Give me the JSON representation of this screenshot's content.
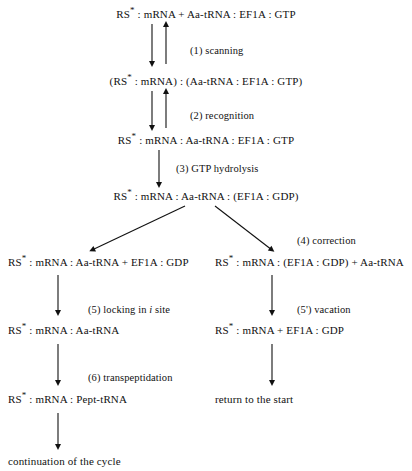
{
  "diagram": {
    "title_text": "Translation elongation cycle scheme",
    "nodes": [
      {
        "id": "n1",
        "text": "RS* : mRNA + Aa-tRNA : EF1A : GTP"
      },
      {
        "id": "n2",
        "text": "(RS* : mRNA) : (Aa-tRNA : EF1A : GTP)"
      },
      {
        "id": "n3",
        "text": "RS* : mRNA : Aa-tRNA : EF1A : GTP"
      },
      {
        "id": "n4",
        "text": "RS* : mRNA : Aa-tRNA : (EF1A : GDP)"
      },
      {
        "id": "n5",
        "text": "RS* : mRNA : Aa-tRNA + EF1A : GDP"
      },
      {
        "id": "n6",
        "text": "RS* : mRNA : (EF1A : GDP) + Aa-tRNA"
      },
      {
        "id": "n7",
        "text": "RS* : mRNA : Aa-tRNA"
      },
      {
        "id": "n8",
        "text": "RS* : mRNA + EF1A : GDP"
      },
      {
        "id": "n9",
        "text": "RS* : mRNA : Pept-tRNA"
      },
      {
        "id": "n10",
        "text": "return to the start"
      },
      {
        "id": "n11",
        "text": "continuation of the cycle"
      }
    ],
    "step_labels": [
      {
        "id": "s1",
        "text": "(1) scanning"
      },
      {
        "id": "s2",
        "text": "(2) recognition"
      },
      {
        "id": "s3",
        "text": "(3) GTP hydrolysis"
      },
      {
        "id": "s4",
        "text": "(4) correction"
      },
      {
        "id": "s5",
        "text": "(5) locking in i site"
      },
      {
        "id": "s5p",
        "text": "(5') vacation"
      },
      {
        "id": "s6",
        "text": "(6) transpeptidation"
      }
    ],
    "colors": {
      "ink": "#111111",
      "background": "#ffffff"
    }
  }
}
